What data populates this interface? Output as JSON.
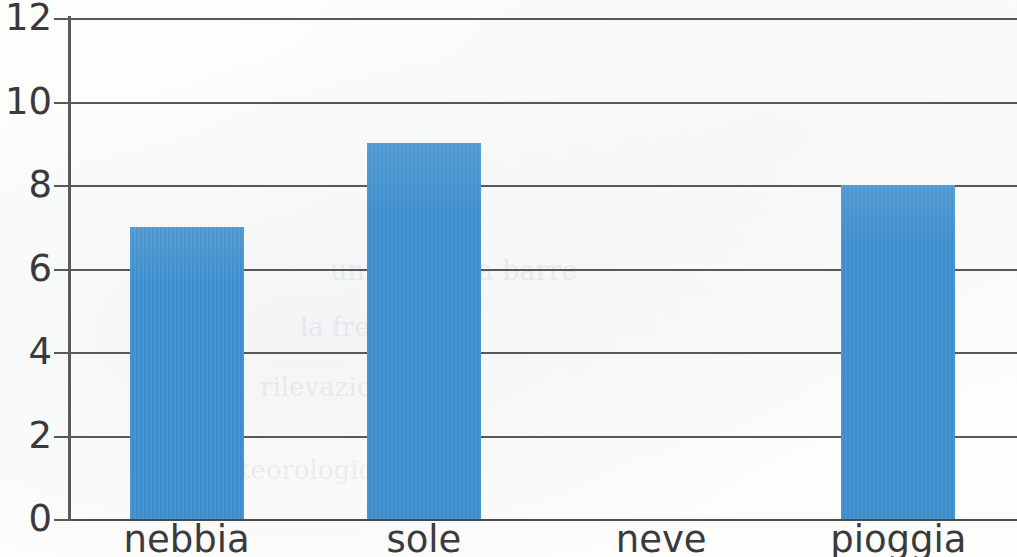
{
  "chart_data": {
    "type": "bar",
    "title": "",
    "subtitle": "",
    "xlabel": "",
    "ylabel": "",
    "categories": [
      "nebbia",
      "sole",
      "neve",
      "pioggia"
    ],
    "values": [
      7,
      9,
      0,
      8
    ],
    "series": [
      {
        "name": "",
        "values": [
          7,
          9,
          0,
          8
        ]
      }
    ],
    "ylim": [
      0,
      12
    ],
    "y_ticks": [
      "0",
      "2",
      "4",
      "6",
      "8",
      "10",
      "12"
    ],
    "y_tick_values": [
      0,
      2,
      4,
      6,
      8,
      10,
      12
    ],
    "grid": true,
    "legend": false,
    "legend_position": "none",
    "bar_color": "#3e90cf",
    "axis_color": "#58585a",
    "text_color": "#3a3a3c",
    "background": "#fdfdfc",
    "annotations": []
  },
  "ghost_text": {
    "line1": "un grafico a barre",
    "line2": "la frequenza",
    "line3": "rilevazione",
    "line4": "meteorologiche"
  }
}
